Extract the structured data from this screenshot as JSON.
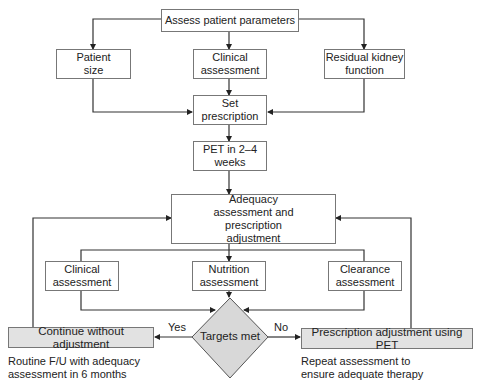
{
  "diagram": {
    "nodes": {
      "assess": "Assess patient parameters",
      "patient_size": "Patient size",
      "clinical_top": "Clinical assessment",
      "residual": "Residual kidney function",
      "set_rx": "Set prescription",
      "pet": "PET in 2–4 weeks",
      "adequacy": "Adequacy assessment and prescription adjustment",
      "clinical_bottom": "Clinical assessment",
      "nutrition": "Nutrition assessment",
      "clearance": "Clearance assessment",
      "decision": "Targets met",
      "continue": "Continue without adjustment",
      "rx_adjust": "Prescription adjustment using PET"
    },
    "edge_labels": {
      "yes": "Yes",
      "no": "No"
    },
    "notes": {
      "left": "Routine F/U with adequacy assessment in 6 months",
      "right": "Repeat assessment to ensure adequate therapy"
    },
    "colors": {
      "line": "#333333",
      "box_border": "#777777",
      "grey_fill": "#e2e2e2",
      "diamond_fill": "#d8d8d8"
    }
  }
}
